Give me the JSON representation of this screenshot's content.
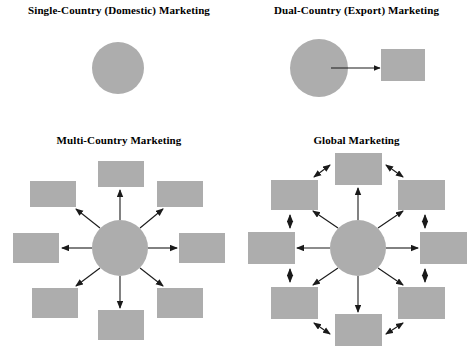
{
  "figure": {
    "background": "#ffffff",
    "shape_color": "#adadad",
    "line_color": "#1a1a1a"
  },
  "panels": [
    {
      "id": "single-country",
      "title": "Single-Country (Domestic) Marketing",
      "hub": {
        "shape": "circle",
        "cx": 118,
        "cy": 68,
        "r": 26
      },
      "satellites": [],
      "hub_arrows": 0,
      "ring_arrows": 0
    },
    {
      "id": "dual-country",
      "title": "Dual-Country (Export) Marketing",
      "hub": {
        "shape": "circle",
        "cx": 81,
        "cy": 68,
        "r": 29
      },
      "satellites": [
        {
          "shape": "rect",
          "x": 143,
          "y": 49,
          "w": 44,
          "h": 32
        }
      ],
      "hub_arrows": 1,
      "ring_arrows": 0,
      "arrow_style": "single-headed"
    },
    {
      "id": "multi-country",
      "title": "Multi-Country Marketing",
      "hub": {
        "shape": "circle",
        "cx": 120,
        "cy": 128,
        "r": 28
      },
      "satellites": [
        {
          "shape": "rect",
          "x": 98,
          "y": 41,
          "w": 46,
          "h": 26,
          "position": "top"
        },
        {
          "shape": "rect",
          "x": 157,
          "y": 61,
          "w": 46,
          "h": 26,
          "position": "top-right"
        },
        {
          "shape": "rect",
          "x": 179,
          "y": 113,
          "w": 46,
          "h": 30,
          "position": "right"
        },
        {
          "shape": "rect",
          "x": 157,
          "y": 168,
          "w": 46,
          "h": 30,
          "position": "bottom-right"
        },
        {
          "shape": "rect",
          "x": 98,
          "y": 190,
          "w": 46,
          "h": 30,
          "position": "bottom"
        },
        {
          "shape": "rect",
          "x": 32,
          "y": 168,
          "w": 46,
          "h": 30,
          "position": "bottom-left"
        },
        {
          "shape": "rect",
          "x": 13,
          "y": 113,
          "w": 46,
          "h": 30,
          "position": "left"
        },
        {
          "shape": "rect",
          "x": 30,
          "y": 61,
          "w": 46,
          "h": 26,
          "position": "top-left"
        }
      ],
      "hub_arrows": 8,
      "ring_arrows": 0,
      "arrow_style": "single-headed"
    },
    {
      "id": "global",
      "title": "Global Marketing",
      "hub": {
        "shape": "circle",
        "cx": 120,
        "cy": 128,
        "r": 28
      },
      "satellites": [
        {
          "shape": "rect",
          "x": 97,
          "y": 33,
          "w": 47,
          "h": 32,
          "position": "top"
        },
        {
          "shape": "rect",
          "x": 160,
          "y": 60,
          "w": 47,
          "h": 30,
          "position": "top-right"
        },
        {
          "shape": "rect",
          "x": 182,
          "y": 112,
          "w": 47,
          "h": 32,
          "position": "right"
        },
        {
          "shape": "rect",
          "x": 160,
          "y": 167,
          "w": 47,
          "h": 32,
          "position": "bottom-right"
        },
        {
          "shape": "rect",
          "x": 97,
          "y": 194,
          "w": 47,
          "h": 32,
          "position": "bottom"
        },
        {
          "shape": "rect",
          "x": 33,
          "y": 167,
          "w": 47,
          "h": 32,
          "position": "bottom-left"
        },
        {
          "shape": "rect",
          "x": 10,
          "y": 112,
          "w": 47,
          "h": 32,
          "position": "left"
        },
        {
          "shape": "rect",
          "x": 33,
          "y": 60,
          "w": 47,
          "h": 30,
          "position": "top-left"
        }
      ],
      "hub_arrows": 8,
      "ring_arrows": 8,
      "arrow_style": "double-headed"
    }
  ]
}
